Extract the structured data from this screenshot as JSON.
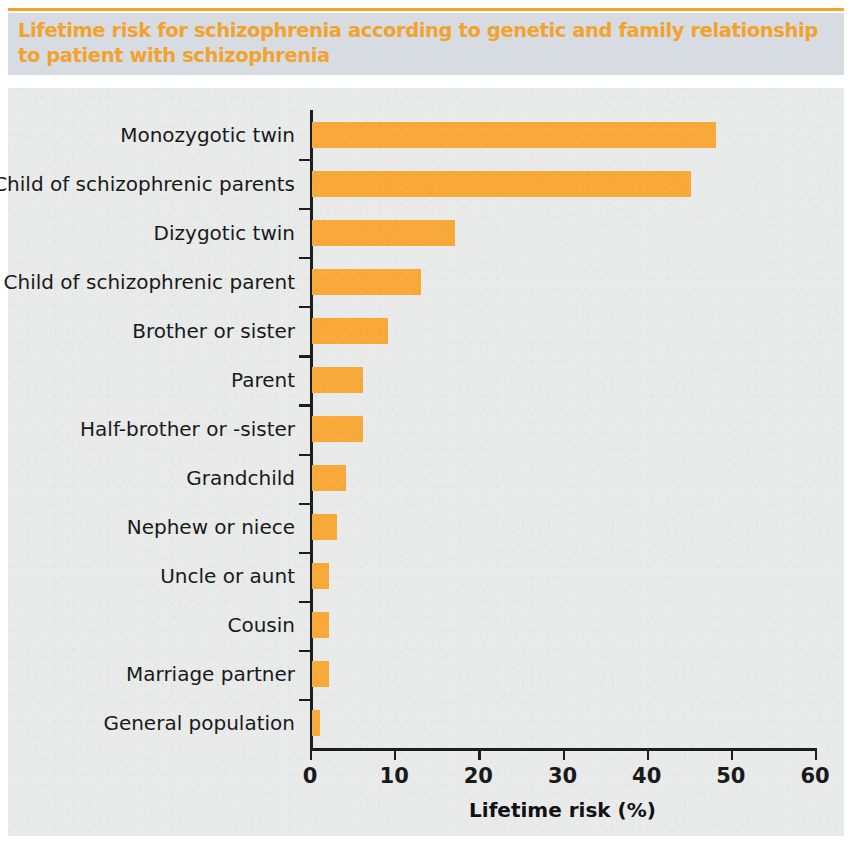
{
  "figure": {
    "title": "Lifetime risk for schizophrenia according to genetic and family relationship to patient with schizophrenia",
    "accent_color": "#F3A22D",
    "bar_color": "#F9A83A",
    "title_band_color": "#D6DCE2",
    "plot_background_color": "#E9EAEA"
  },
  "chart_data": {
    "type": "bar",
    "orientation": "horizontal",
    "title": "Lifetime risk for schizophrenia according to genetic and family relationship to patient with schizophrenia",
    "xlabel": "Lifetime risk (%)",
    "ylabel": "",
    "xlim": [
      0,
      60
    ],
    "xticks": [
      0,
      10,
      20,
      30,
      40,
      50,
      60
    ],
    "xticklabels": [
      "0",
      "10",
      "20",
      "30",
      "40",
      "50",
      "60"
    ],
    "grid": false,
    "legend": null,
    "categories": [
      "Monozygotic twin",
      "Child of schizophrenic parents",
      "Dizygotic twin",
      "Child of schizophrenic parent",
      "Brother or sister",
      "Parent",
      "Half-brother or -sister",
      "Grandchild",
      "Nephew or niece",
      "Uncle or aunt",
      "Cousin",
      "Marriage partner",
      "General population"
    ],
    "values": [
      48,
      45,
      17,
      13,
      9,
      6,
      6,
      4,
      3,
      2,
      2,
      2,
      1
    ],
    "series": [
      {
        "name": "Lifetime risk (%)",
        "color": "#F9A83A",
        "values": [
          48,
          45,
          17,
          13,
          9,
          6,
          6,
          4,
          3,
          2,
          2,
          2,
          1
        ]
      }
    ]
  }
}
